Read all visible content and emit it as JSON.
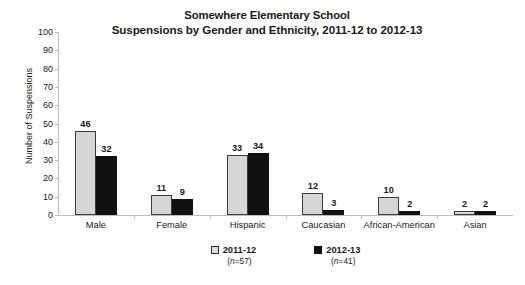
{
  "chart_data": {
    "type": "bar",
    "title": "Somewhere Elementary School\nSuspensions by Gender and Ethnicity, 2011-12 to 2012-13",
    "title_line1": "Somewhere Elementary School",
    "title_line2": "Suspensions by Gender and Ethnicity, 2011-12 to 2012-13",
    "xlabel": "",
    "ylabel": "Number of Suspensions",
    "ylim": [
      0,
      100
    ],
    "ytick_step": 10,
    "yticks": [
      "100",
      "90",
      "80",
      "70",
      "60",
      "50",
      "40",
      "30",
      "20",
      "10",
      "0"
    ],
    "grid": false,
    "legend_position": "bottom-center",
    "categories": [
      "Male",
      "Female",
      "Hispanic",
      "Caucasian",
      "African-American",
      "Asian"
    ],
    "series": [
      {
        "name": "2011-12",
        "n_label": "(n=57)",
        "n_value": 57,
        "color": "#d6d6d6",
        "values": [
          46,
          11,
          33,
          12,
          10,
          2
        ]
      },
      {
        "name": "2012-13",
        "n_label": "(n=41)",
        "n_value": 41,
        "color": "#111111",
        "values": [
          32,
          9,
          34,
          3,
          2,
          2
        ]
      }
    ],
    "data_labels": [
      [
        "46",
        "32"
      ],
      [
        "11",
        "9"
      ],
      [
        "33",
        "34"
      ],
      [
        "12",
        "3"
      ],
      [
        "10",
        "2"
      ],
      [
        "2",
        "2"
      ]
    ]
  },
  "legend": {
    "items": [
      {
        "label": "2011-12",
        "n": "(n=57)",
        "n_prefix": "n",
        "n_suffix": "=57)",
        "n_open": "("
      },
      {
        "label": "2012-13",
        "n": "(n=41)",
        "n_prefix": "n",
        "n_suffix": "=41)",
        "n_open": "("
      }
    ]
  },
  "colors": {
    "series1": "#d6d6d6",
    "series2": "#111111",
    "axis": "#bdbdbd",
    "text": "#1a1a1a",
    "background": "#ffffff"
  }
}
